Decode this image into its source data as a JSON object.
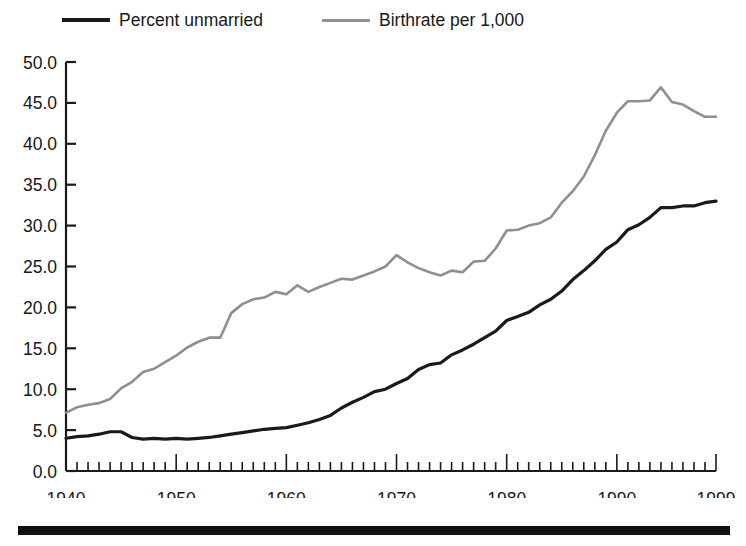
{
  "chart_data": {
    "type": "line",
    "title": "",
    "subtitle": "",
    "xlabel": "",
    "ylabel": "",
    "xlim": [
      1940,
      1999
    ],
    "ylim": [
      0.0,
      50.0
    ],
    "grid": false,
    "legend_position": "top",
    "y_ticks": [
      "0.0",
      "5.0",
      "10.0",
      "15.0",
      "20.0",
      "25.0",
      "30.0",
      "35.0",
      "40.0",
      "45.0",
      "50.0"
    ],
    "y_tick_values": [
      0,
      5,
      10,
      15,
      20,
      25,
      30,
      35,
      40,
      45,
      50
    ],
    "x_ticks": [
      "1940",
      "1950",
      "1960",
      "1970",
      "1980",
      "1990",
      "1999"
    ],
    "x_tick_values": [
      1940,
      1950,
      1960,
      1970,
      1980,
      1990,
      1999
    ],
    "x_minor_tick_step": 1,
    "x": [
      1940,
      1941,
      1942,
      1943,
      1944,
      1945,
      1946,
      1947,
      1948,
      1949,
      1950,
      1951,
      1952,
      1953,
      1954,
      1955,
      1956,
      1957,
      1958,
      1959,
      1960,
      1961,
      1962,
      1963,
      1964,
      1965,
      1966,
      1967,
      1968,
      1969,
      1970,
      1971,
      1972,
      1973,
      1974,
      1975,
      1976,
      1977,
      1978,
      1979,
      1980,
      1981,
      1982,
      1983,
      1984,
      1985,
      1986,
      1987,
      1988,
      1989,
      1990,
      1991,
      1992,
      1993,
      1994,
      1995,
      1996,
      1997,
      1998,
      1999
    ],
    "series": [
      {
        "name": "Percent unmarried",
        "color": "#1a1a1a",
        "line_width": 3.2,
        "values": [
          4.0,
          4.2,
          4.3,
          4.5,
          4.8,
          4.8,
          4.1,
          3.9,
          4.0,
          3.9,
          4.0,
          3.9,
          4.0,
          4.1,
          4.3,
          4.5,
          4.7,
          4.9,
          5.1,
          5.2,
          5.3,
          5.6,
          5.9,
          6.3,
          6.8,
          7.7,
          8.4,
          9.0,
          9.7,
          10.0,
          10.7,
          11.3,
          12.4,
          13.0,
          13.2,
          14.2,
          14.8,
          15.5,
          16.3,
          17.1,
          18.4,
          18.9,
          19.4,
          20.3,
          21.0,
          22.0,
          23.4,
          24.5,
          25.7,
          27.1,
          28.0,
          29.5,
          30.1,
          31.0,
          32.2,
          32.2,
          32.4,
          32.4,
          32.8,
          33.0
        ]
      },
      {
        "name": "Birthrate per 1,000",
        "color": "#8f8f8f",
        "line_width": 2.6,
        "values": [
          7.1,
          7.8,
          8.1,
          8.3,
          8.8,
          10.1,
          10.9,
          12.1,
          12.5,
          13.3,
          14.1,
          15.1,
          15.8,
          16.3,
          16.3,
          19.3,
          20.4,
          21.0,
          21.2,
          21.9,
          21.6,
          22.7,
          21.9,
          22.5,
          23.0,
          23.5,
          23.4,
          23.9,
          24.4,
          25.0,
          26.4,
          25.5,
          24.8,
          24.3,
          23.9,
          24.5,
          24.3,
          25.6,
          25.7,
          27.2,
          29.4,
          29.5,
          30.0,
          30.3,
          31.0,
          32.8,
          34.2,
          36.0,
          38.6,
          41.6,
          43.8,
          45.2,
          45.2,
          45.3,
          46.9,
          45.1,
          44.8,
          44.0,
          43.3,
          43.3
        ]
      }
    ]
  },
  "axes": {
    "y_axis_name": "value-axis",
    "x_axis_name": "year-axis"
  },
  "decorations": {
    "bottom_rule": "horizontal-rule"
  }
}
